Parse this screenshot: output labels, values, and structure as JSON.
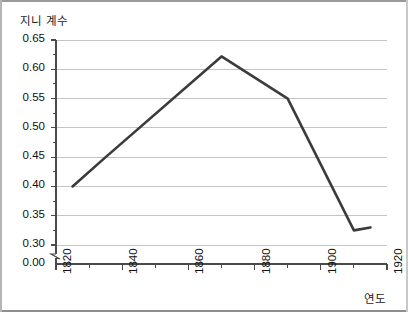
{
  "chart_data": {
    "type": "line",
    "title": "",
    "ylabel": "지니 계수",
    "xlabel": "연도",
    "grid": true,
    "legend": false,
    "xlim": [
      1820,
      1920
    ],
    "ylim": [
      0.3,
      0.65
    ],
    "y_axis_break": true,
    "y_baseline_label": "0.00",
    "x_ticks": [
      1820,
      1840,
      1860,
      1880,
      1900,
      1920
    ],
    "x_tick_labels": [
      "1820",
      "1840",
      "1860",
      "1880",
      "1900",
      "1920"
    ],
    "x_minor_ticks": [
      1830,
      1850,
      1870,
      1890,
      1910
    ],
    "y_ticks": [
      0.3,
      0.35,
      0.4,
      0.45,
      0.5,
      0.55,
      0.6,
      0.65
    ],
    "y_tick_labels": [
      "0.30",
      "0.35",
      "0.40",
      "0.45",
      "0.50",
      "0.55",
      "0.60",
      "0.65"
    ],
    "y_minor_ticks": [
      0.325,
      0.375,
      0.425,
      0.475,
      0.525,
      0.575,
      0.625
    ],
    "series": [
      {
        "name": "지니 계수",
        "color": "#3b3b3b",
        "x": [
          1825,
          1835,
          1870,
          1890,
          1910,
          1915
        ],
        "values": [
          0.4,
          0.45,
          0.622,
          0.55,
          0.325,
          0.33
        ]
      }
    ]
  },
  "colors": {
    "line": "#3b3b3b",
    "grid": "#c4c4c4",
    "axis": "#4a4a4a",
    "text": "#111111",
    "frame": "#9a9a9a",
    "background": "#ffffff"
  }
}
